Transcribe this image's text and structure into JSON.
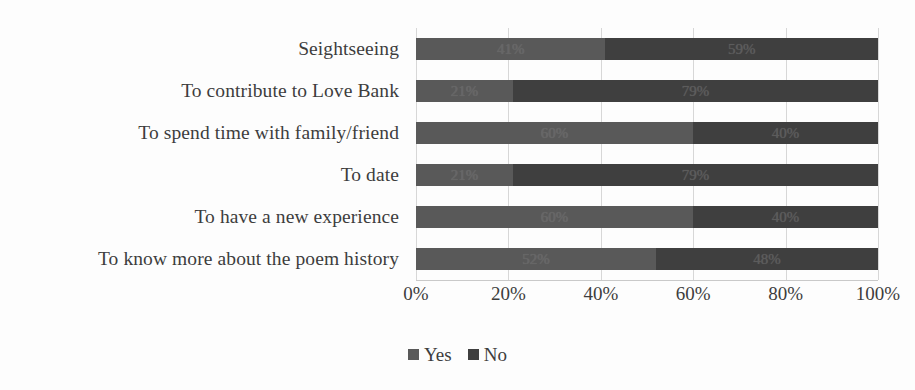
{
  "chart_data": {
    "type": "bar",
    "subtype": "stacked-horizontal-100-percent",
    "title": "",
    "xlabel": "",
    "ylabel": "",
    "categories": [
      "Seightseeing",
      "To contribute to Love Bank",
      "To spend time with family/friend",
      "To date",
      "To have a new experience",
      "To know more about the poem history"
    ],
    "series": [
      {
        "name": "Yes",
        "color": "#595959",
        "values": [
          41,
          21,
          60,
          21,
          60,
          52
        ],
        "labels": [
          "41%",
          "21%",
          "60%",
          "21%",
          "60%",
          "52%"
        ]
      },
      {
        "name": "No",
        "color": "#3f3f3f",
        "values": [
          59,
          79,
          40,
          79,
          40,
          48
        ],
        "labels": [
          "59%",
          "79%",
          "40%",
          "79%",
          "40%",
          "48%"
        ]
      }
    ],
    "xlim": [
      0,
      100
    ],
    "xticks": [
      0,
      20,
      40,
      60,
      80,
      100
    ],
    "xtick_labels": [
      "0%",
      "20%",
      "40%",
      "60%",
      "80%",
      "100%"
    ],
    "grid": true,
    "grid_axis": "x",
    "legend_position": "bottom-center"
  }
}
